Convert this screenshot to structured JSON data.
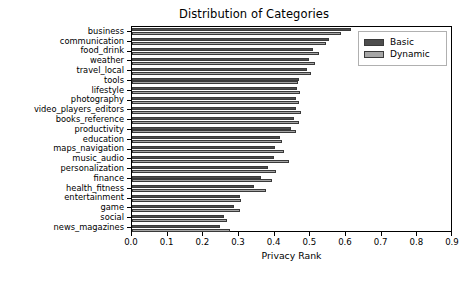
{
  "chart_data": {
    "type": "bar",
    "orientation": "horizontal",
    "title": "Distribution of Categories",
    "xlabel": "Privacy Rank",
    "ylabel": "",
    "xlim": [
      0.0,
      0.9
    ],
    "grid": false,
    "legend_position": "upper right",
    "xticks": [
      "0.0",
      "0.1",
      "0.2",
      "0.3",
      "0.4",
      "0.5",
      "0.6",
      "0.7",
      "0.8",
      "0.9"
    ],
    "xtick_values": [
      0.0,
      0.1,
      0.2,
      0.3,
      0.4,
      0.5,
      0.6,
      0.7,
      0.8,
      0.9
    ],
    "categories": [
      "business",
      "communication",
      "food_drink",
      "weather",
      "travel_local",
      "tools",
      "lifestyle",
      "photography",
      "video_players_editors",
      "books_reference",
      "productivity",
      "education",
      "maps_navigation",
      "music_audio",
      "personalization",
      "finance",
      "health_fitness",
      "entertainment",
      "game",
      "social",
      "news_magazines"
    ],
    "series": [
      {
        "name": "Basic",
        "color": "#4d4d4d",
        "values": [
          0.613,
          0.552,
          0.508,
          0.497,
          0.49,
          0.468,
          0.464,
          0.461,
          0.459,
          0.455,
          0.447,
          0.414,
          0.402,
          0.399,
          0.381,
          0.363,
          0.341,
          0.302,
          0.285,
          0.259,
          0.247
        ]
      },
      {
        "name": "Dynamic",
        "color": "#a6a6a6",
        "values": [
          0.585,
          0.545,
          0.524,
          0.513,
          0.503,
          0.466,
          0.472,
          0.469,
          0.473,
          0.468,
          0.46,
          0.421,
          0.425,
          0.44,
          0.405,
          0.393,
          0.375,
          0.307,
          0.304,
          0.266,
          0.276
        ]
      }
    ]
  },
  "legend": {
    "entries": [
      {
        "label": "Basic",
        "color": "#4d4d4d"
      },
      {
        "label": "Dynamic",
        "color": "#a6a6a6"
      }
    ]
  },
  "colors": {
    "basic": "#4d4d4d",
    "dynamic": "#a6a6a6",
    "axis": "#000000",
    "background": "#ffffff"
  }
}
